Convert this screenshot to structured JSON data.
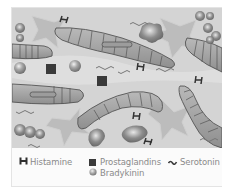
{
  "figure": {
    "colors": {
      "background": "#d2d2d2",
      "cell_fill": "#a9a9a9",
      "cell_stroke": "#5a5a5a",
      "star_fill": "#bdbdbd",
      "prostaglandin": "#3c3c3c",
      "bradykinin": "#9a9a9a",
      "histamine": "#3a3a3a",
      "serotonin": "#7a7a7a",
      "legend_text": "#8a8a8a"
    }
  },
  "legend": {
    "items": [
      {
        "id": "histamine",
        "label": "Histamine",
        "icon": "histamine-H-icon"
      },
      {
        "id": "prostaglandins",
        "label": "Prostaglandins",
        "icon": "square-icon"
      },
      {
        "id": "serotonin",
        "label": "Serotonin",
        "icon": "squiggle-icon"
      },
      {
        "id": "bradykinin",
        "label": "Bradykinin",
        "icon": "sphere-icon"
      }
    ]
  }
}
